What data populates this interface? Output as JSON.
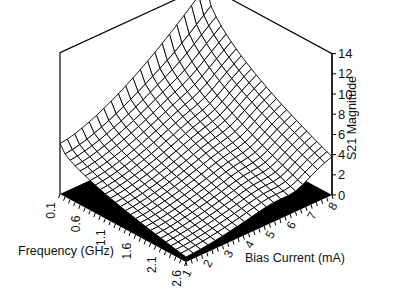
{
  "chart_data": {
    "type": "surface3d",
    "title": "",
    "xlabel": "Frequency  (GHz)",
    "ylabel": "Bias Current  (mA)",
    "zlabel": "S21 Magnitude",
    "x_ticks": [
      "0.1",
      "0.6",
      "1.1",
      "1.6",
      "2.1",
      "2.6"
    ],
    "x_range": [
      0.1,
      2.6
    ],
    "x_step": 0.1,
    "y_ticks": [
      "1",
      "2",
      "3",
      "4",
      "5",
      "6",
      "7",
      "8"
    ],
    "y_range": [
      1,
      8
    ],
    "z_ticks": [
      "0",
      "2",
      "4",
      "6",
      "8",
      "10",
      "12",
      "14"
    ],
    "zlim": [
      0,
      14
    ],
    "corner_values": {
      "freq_0.1_bias_1": 5.0,
      "freq_0.1_bias_8": 14.0,
      "freq_2.6_bias_1": 0.5,
      "freq_2.6_bias_8": 3.8
    },
    "grid": true,
    "base_fill": "#000000",
    "line_color": "#000000"
  }
}
